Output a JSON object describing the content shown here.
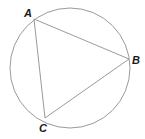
{
  "diagram": {
    "type": "inscribed-triangle",
    "circle": {
      "cx": 70,
      "cy": 68,
      "r": 60,
      "stroke": "#9a9a9a"
    },
    "triangle_stroke": "#9a9a9a",
    "vertices": [
      {
        "label": "A",
        "x": 34,
        "y": 19,
        "lx": 24,
        "ly": 17
      },
      {
        "label": "B",
        "x": 129,
        "y": 59,
        "lx": 132,
        "ly": 64
      },
      {
        "label": "C",
        "x": 45,
        "y": 118,
        "lx": 39,
        "ly": 132
      }
    ]
  }
}
